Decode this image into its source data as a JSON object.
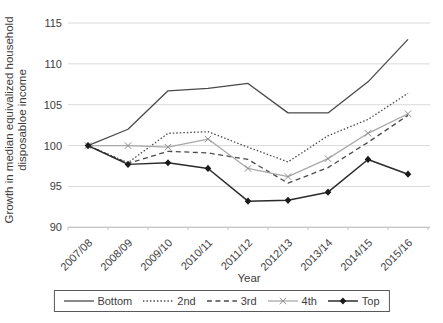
{
  "chart_data": {
    "type": "line",
    "title": "",
    "xlabel": "Year",
    "ylabel": "Growth in median equivalized household disposabloe income",
    "ylabel_lines": [
      "Growth in median equivalized household",
      "disposabloe income"
    ],
    "ylim": [
      90,
      115
    ],
    "yticks": [
      90,
      95,
      100,
      105,
      110,
      115
    ],
    "grid": "horizontal",
    "legend_position": "bottom",
    "categories": [
      "2007/08",
      "2008/09",
      "2009/10",
      "2010/11",
      "2011/12",
      "2012/13",
      "2013/14",
      "2014/15",
      "2015/16"
    ],
    "series": [
      {
        "name": "Bottom",
        "style": "solid",
        "marker": "none",
        "color": "#4a4a4a",
        "values": [
          100,
          102.0,
          106.7,
          107.0,
          107.6,
          104.0,
          104.0,
          107.8,
          113.0
        ]
      },
      {
        "name": "2nd",
        "style": "dotted",
        "marker": "none",
        "color": "#4a4a4a",
        "values": [
          100,
          97.9,
          101.5,
          101.7,
          99.8,
          98.0,
          101.2,
          103.2,
          106.4
        ]
      },
      {
        "name": "3rd",
        "style": "dashed",
        "marker": "none",
        "color": "#4a4a4a",
        "values": [
          100,
          97.8,
          99.3,
          99.1,
          98.3,
          95.4,
          97.3,
          100.4,
          103.7
        ]
      },
      {
        "name": "4th",
        "style": "solid",
        "marker": "x",
        "color": "#a9a9a9",
        "marker_color": "#8c8c8c",
        "values": [
          100,
          100.0,
          99.8,
          100.8,
          97.2,
          96.2,
          98.4,
          101.5,
          103.9
        ]
      },
      {
        "name": "Top",
        "style": "solid",
        "marker": "diamond",
        "color": "#2b2b2b",
        "marker_color": "#1a1a1a",
        "values": [
          100,
          97.7,
          97.9,
          97.2,
          93.2,
          93.3,
          94.3,
          98.3,
          96.5
        ]
      }
    ],
    "colors": {
      "gridline": "#d9d9d9",
      "axis": "#bfbfbf",
      "text": "#3d3d3d"
    }
  }
}
